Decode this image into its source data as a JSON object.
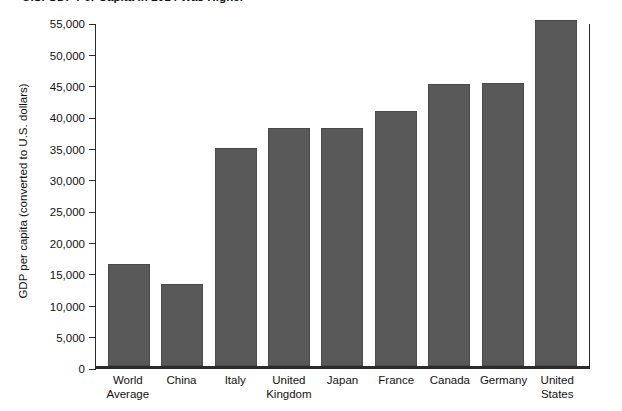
{
  "chart_data": {
    "type": "bar",
    "title": "U.S. GDP Per Capita in 2014 Was Higher",
    "xlabel": "",
    "ylabel": "GDP per capita (converted to U.S. dollars)",
    "ylim": [
      0,
      55000
    ],
    "ytick_interval": 5000,
    "grid": false,
    "legend": "none",
    "bar_color": "#595959",
    "axis_color": "#2b2b2b",
    "categories": [
      "World Average",
      "China",
      "Italy",
      "United Kingdom",
      "Japan",
      "France",
      "Canada",
      "Germany",
      "United States"
    ],
    "category_lines": [
      [
        "World",
        "Average"
      ],
      [
        "China",
        ""
      ],
      [
        "Italy",
        ""
      ],
      [
        "United",
        "Kingdom"
      ],
      [
        "Japan",
        ""
      ],
      [
        "France",
        ""
      ],
      [
        "Canada",
        ""
      ],
      [
        "Germany",
        ""
      ],
      [
        "United",
        "States"
      ]
    ],
    "values": [
      16200,
      13000,
      34700,
      37900,
      38000,
      40700,
      44900,
      45100,
      55200
    ],
    "ytick_labels": [
      "55,000",
      "50,000",
      "45,000",
      "40,000",
      "35,000",
      "30,000",
      "25,000",
      "20,000",
      "15,000",
      "10,000",
      "5,000",
      "0"
    ],
    "ytick_values": [
      55000,
      50000,
      45000,
      40000,
      35000,
      30000,
      25000,
      20000,
      15000,
      10000,
      5000,
      0
    ]
  }
}
